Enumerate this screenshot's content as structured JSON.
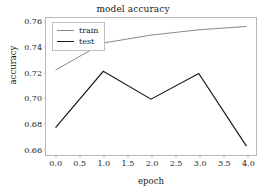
{
  "chart_data": {
    "type": "line",
    "title": "model accuracy",
    "xlabel": "epoch",
    "ylabel": "accuracy",
    "x": [
      0,
      1,
      2,
      3,
      4
    ],
    "xlim": [
      -0.2,
      4.2
    ],
    "ylim": [
      0.6545,
      0.7625
    ],
    "xticks": [
      0.0,
      0.5,
      1.0,
      1.5,
      2.0,
      2.5,
      3.0,
      3.5,
      4.0
    ],
    "xtick_labels": [
      "0.0",
      "0.5",
      "1.0",
      "1.5",
      "2.0",
      "2.5",
      "3.0",
      "3.5",
      "4.0"
    ],
    "yticks": [
      0.66,
      0.68,
      0.7,
      0.72,
      0.74,
      0.76
    ],
    "ytick_labels": [
      "0.66",
      "0.68",
      "0.70",
      "0.72",
      "0.74",
      "0.76"
    ],
    "grid": false,
    "legend_position": "upper left",
    "series": [
      {
        "name": "train",
        "color": "#8a8a8a",
        "linewidth": 1.0,
        "values": [
          0.7215,
          0.7428,
          0.749,
          0.7532,
          0.7558
        ]
      },
      {
        "name": "test",
        "color": "#1a1a1a",
        "linewidth": 1.2,
        "values": [
          0.676,
          0.7205,
          0.6985,
          0.7188,
          0.6615
        ]
      }
    ]
  },
  "legend": {
    "entries": [
      {
        "label": "train"
      },
      {
        "label": "test"
      }
    ]
  },
  "style": {
    "background": "#ffffff",
    "spine_color": "#b8b8b8",
    "text_color": "#1a1a1a"
  }
}
